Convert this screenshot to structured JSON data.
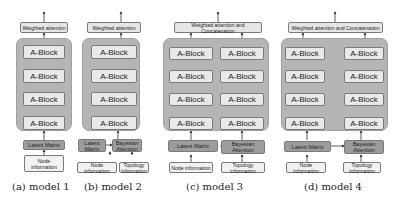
{
  "models": [
    {
      "id": "model1",
      "caption": "(a) model 1",
      "top": "Weighted attention",
      "blocks": [
        "A-Block",
        "A-Block",
        "A-Block",
        "A-Block"
      ],
      "latent": "Latent Matrix",
      "inputs": [
        "Node information"
      ]
    },
    {
      "id": "model2",
      "caption": "(b) model 2",
      "top": "Weighted attention",
      "blocks": [
        "A-Block",
        "A-Block",
        "A-Block",
        "A-Block"
      ],
      "latent": "Latent Matrix",
      "bayes": "Bayesian Attention",
      "inputs": [
        "Node information",
        "Topology information"
      ]
    },
    {
      "id": "model3",
      "caption": "(c) model 3",
      "top": "Weighted attention and Concatenation",
      "blocks_left": [
        "A-Block",
        "A-Block",
        "A-Block",
        "A-Block"
      ],
      "blocks_right": [
        "A-Block",
        "A-Block",
        "A-Block",
        "A-Block"
      ],
      "latent": "Latent Matrix",
      "bayes": "Bayesian Attention",
      "inputs": [
        "Node information",
        "Topology information"
      ]
    },
    {
      "id": "model4",
      "caption": "(d) model 4",
      "top": "Weighted attention and Concatenation",
      "blocks_left": [
        "A-Block",
        "A-Block",
        "A-Block",
        "A-Block"
      ],
      "blocks_right": [
        "A-Block",
        "A-Block",
        "A-Block",
        "A-Block"
      ],
      "latent": "Latent Matrix",
      "bayes": "Bayesian Attention",
      "inputs": [
        "Node information",
        "Topology information"
      ]
    }
  ]
}
